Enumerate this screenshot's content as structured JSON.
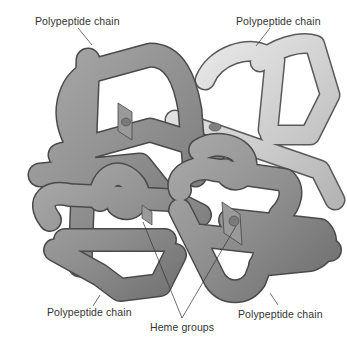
{
  "figure": {
    "labels": {
      "top_left": "Polypeptide chain",
      "top_right": "Polypeptide chain",
      "bottom_left": "Polypeptide chain",
      "bottom_right": "Polypeptide chain",
      "heme": "Heme groups"
    },
    "colors": {
      "background": "#ffffff",
      "dark_chain": "#8c8c8c",
      "dark_chain_highlight": "#b4b4b4",
      "light_chain": "#cfcfcf",
      "light_chain_highlight": "#ececec",
      "outline": "#4a4a4a",
      "leader_line": "#333333",
      "text": "#333333"
    }
  }
}
